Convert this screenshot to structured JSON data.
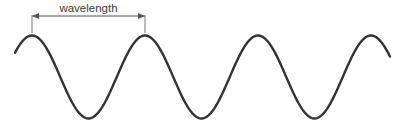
{
  "diagram": {
    "label": "wavelength",
    "wave": {
      "color": "#333333",
      "stroke_width": 2.4,
      "x_start": 15,
      "x_end": 390,
      "center_y": 77,
      "amplitude": 41.5,
      "wavelength_px": 113,
      "first_peak_x": 32,
      "peaks_x": [
        32,
        145,
        258,
        372
      ],
      "troughs_x": [
        88,
        315
      ]
    },
    "dimension": {
      "color": "#555555",
      "x1": 32,
      "x2": 145,
      "line_y": 16,
      "tick_top": 15,
      "tick_bottom": 33
    }
  }
}
